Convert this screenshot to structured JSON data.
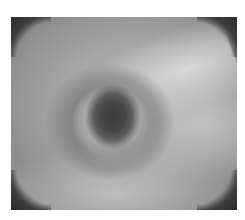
{
  "image": {
    "description": "Grayscale endoscopic photograph showing a dark central lumen opening surrounded by a gray mucosal ring, with a lighter band across the upper right and dark circular-field corners",
    "colors": {
      "background": "#ffffff",
      "tissue_mid": "#a6a6a6",
      "tissue_light": "#d8d8d8",
      "ring": "#767676",
      "lumen": "#3a3a3a",
      "corners": "#2a2a2a"
    }
  },
  "caption": {
    "text": ""
  }
}
